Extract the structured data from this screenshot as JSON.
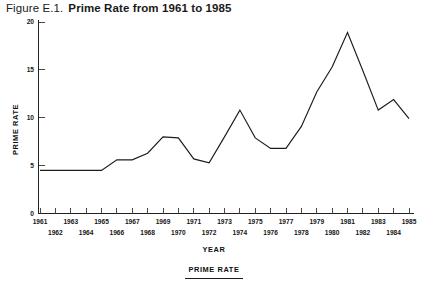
{
  "figure": {
    "figure_number": "Figure E.1.",
    "title": "Prime Rate from 1961 to 1985"
  },
  "chart_data": {
    "type": "line",
    "title": "Prime Rate from 1961 to 1985",
    "xlabel": "YEAR",
    "ylabel": "PRIME RATE",
    "xlim": [
      1961,
      1985
    ],
    "ylim": [
      0,
      20
    ],
    "yticks": [
      0,
      5,
      10,
      15,
      20
    ],
    "ytick_labels": [
      "0",
      "5",
      "10",
      "15",
      "20"
    ],
    "grid": false,
    "legend": {
      "position": "bottom-center",
      "entries": [
        "PRIME RATE"
      ]
    },
    "xtick_label_rows": {
      "top": [
        "1961",
        "1963",
        "1965",
        "1967",
        "1969",
        "1971",
        "1973",
        "1975",
        "1977",
        "1979",
        "1981",
        "1983",
        "1985"
      ],
      "bottom": [
        "1962",
        "1964",
        "1966",
        "1968",
        "1970",
        "1972",
        "1974",
        "1976",
        "1978",
        "1980",
        "1982",
        "1984"
      ]
    },
    "categories": [
      1961,
      1962,
      1963,
      1964,
      1965,
      1966,
      1967,
      1968,
      1969,
      1970,
      1971,
      1972,
      1973,
      1974,
      1975,
      1976,
      1977,
      1978,
      1979,
      1980,
      1981,
      1982,
      1983,
      1984,
      1985
    ],
    "series": [
      {
        "name": "PRIME RATE",
        "color": "#1c1c1c",
        "values": [
          4.5,
          4.5,
          4.5,
          4.5,
          4.5,
          5.6,
          5.6,
          6.3,
          8.0,
          7.9,
          5.7,
          5.3,
          8.0,
          10.8,
          7.9,
          6.8,
          6.8,
          9.1,
          12.7,
          15.3,
          18.9,
          14.9,
          10.8,
          11.9,
          9.9
        ]
      }
    ]
  }
}
